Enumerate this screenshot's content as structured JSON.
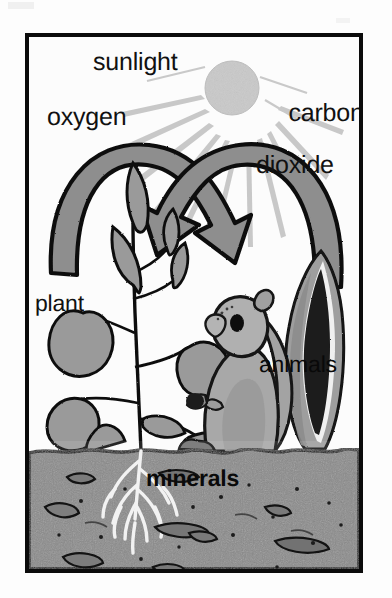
{
  "figure": {
    "title_context": "photosynthesis and respiration cycle diagram",
    "border_color": "#0b0b0b",
    "background_color": "#fbfbfb"
  },
  "labels": {
    "sunlight": "sunlight",
    "carbon": "carbon",
    "dioxide": "dioxide",
    "oxygen": "oxygen",
    "plant": "plant",
    "animals": "animals",
    "minerals": "minerals"
  },
  "elements": {
    "sun": "sun-circle",
    "sun_rays": "sun-rays",
    "oxygen_arrow": "oxygen-curved-arrow",
    "carbon_dioxide_arrow": "carbon-dioxide-curved-arrow",
    "plant_figure": "leafy-plant",
    "roots": "plant-roots",
    "animal_figure": "squirrel",
    "dark_plant": "dark-leaf-plant",
    "soil_band": "soil-layer",
    "mineral_pebbles": "mineral-pebbles"
  },
  "colors": {
    "ink": "#111111",
    "arrow_fill": "#8e8e8e",
    "sun_fill": "#c9c9c9",
    "ray_fill": "#c6c6c6",
    "leaf_fill": "#9a9a9a",
    "soil_fill": "#8a8a8a",
    "root_fill": "#f2f2f2",
    "dark_plant_fill": "#1a1a1a",
    "animal_fill": "#a3a3a3"
  }
}
